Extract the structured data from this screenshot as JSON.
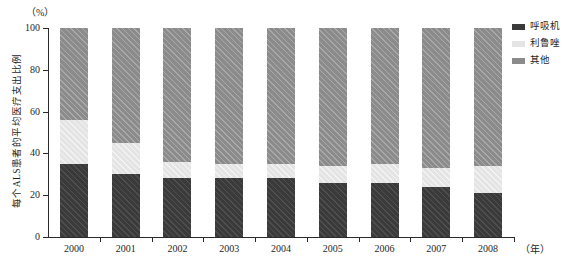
{
  "chart_data": {
    "type": "bar",
    "subtype": "stacked-percentage",
    "title": "",
    "xlabel": "（年）",
    "ylabel": "每个ALS患者的平均医疗支出比例",
    "yunit": "（%）",
    "ylim": [
      0,
      100
    ],
    "yticks": [
      0,
      20,
      40,
      60,
      80,
      100
    ],
    "ytick_labels": [
      "0",
      "20",
      "40",
      "60",
      "80",
      "100"
    ],
    "grid": false,
    "legend_position": "top-right",
    "categories": [
      "2000",
      "2001",
      "2002",
      "2003",
      "2004",
      "2005",
      "2006",
      "2007",
      "2008"
    ],
    "series": [
      {
        "name": "呼吸机",
        "color": "#3a3a3a",
        "values": [
          35,
          30,
          28,
          28,
          28,
          26,
          26,
          24,
          21
        ]
      },
      {
        "name": "利鲁唑",
        "color": "#e4e4e4",
        "values": [
          21,
          15,
          8,
          7,
          7,
          8,
          9,
          9,
          13
        ]
      },
      {
        "name": "其他",
        "color": "#8b8b8b",
        "values": [
          44,
          55,
          64,
          65,
          65,
          66,
          65,
          67,
          66
        ]
      }
    ]
  },
  "legend": {
    "items": [
      {
        "label": "呼吸机",
        "color": "#3a3a3a"
      },
      {
        "label": "利鲁唑",
        "color": "#e4e4e4"
      },
      {
        "label": "其他",
        "color": "#8b8b8b"
      }
    ]
  },
  "axes": {
    "y_unit_label": "（%）",
    "x_unit_label": "（年）",
    "y_axis_title": "每个ALS患者的平均医疗支出比例"
  }
}
